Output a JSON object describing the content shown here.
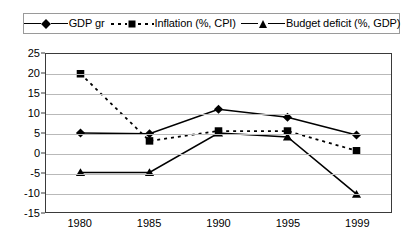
{
  "chart_data": {
    "type": "line",
    "title": "",
    "xlabel": "",
    "ylabel": "",
    "categories": [
      "1980",
      "1985",
      "1990",
      "1995",
      "1999"
    ],
    "x": [
      1980,
      1985,
      1990,
      1995,
      1999
    ],
    "ylim": [
      -15,
      25
    ],
    "ytick_values": [
      25,
      20,
      15,
      10,
      5,
      0,
      -5,
      -10,
      -15
    ],
    "ytick_labels": [
      "25",
      "20",
      "15",
      "10",
      "5",
      "0",
      "-5",
      "-10",
      "-15"
    ],
    "grid": true,
    "legend_position": "top",
    "series": [
      {
        "name": "GDP gr",
        "marker": "diamond",
        "line_style": "solid",
        "color": "#000000",
        "values": [
          5,
          4.8,
          11,
          9,
          4.5
        ]
      },
      {
        "name": "Inflation (%, CPI)",
        "marker": "square",
        "line_style": "dotted",
        "color": "#000000",
        "values": [
          20,
          3,
          5.5,
          5.5,
          0.5
        ]
      },
      {
        "name": "Budget deficit (%, GDP)",
        "marker": "triangle",
        "line_style": "solid",
        "color": "#000000",
        "values": [
          -5,
          -5,
          5,
          4,
          -10.5
        ]
      }
    ]
  },
  "legend": {
    "entries": [
      {
        "label": "GDP gr",
        "marker": "diamond-marker-icon",
        "style": "solid"
      },
      {
        "label": "Inflation (%, CPI)",
        "marker": "square-marker-icon",
        "style": "dotted"
      },
      {
        "label": "Budget deficit (%, GDP)",
        "marker": "triangle-marker-icon",
        "style": "solid"
      }
    ]
  },
  "colors": {
    "series": "#000000",
    "gridline": "#b9b9b9",
    "axis": "#3a3a3a",
    "background": "#ffffff"
  }
}
